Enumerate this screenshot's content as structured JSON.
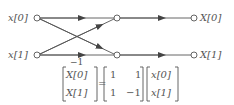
{
  "diagram": {
    "inputs": [
      {
        "label": "x[0]"
      },
      {
        "label": "x[1]"
      }
    ],
    "outputs": [
      {
        "label": "X[0]"
      },
      {
        "label": "X[1]"
      }
    ],
    "branch_gain": "−1",
    "colors": {
      "line": "#555555",
      "text": "#555555",
      "background": "#ffffff"
    }
  },
  "equation": {
    "lhs": [
      "X[0]",
      "X[1]"
    ],
    "equals": "=",
    "matrix": [
      [
        "1",
        "1"
      ],
      [
        "1",
        "−1"
      ]
    ],
    "rhs": [
      "x[0]",
      "x[1]"
    ]
  }
}
